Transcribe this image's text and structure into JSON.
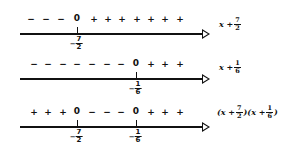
{
  "rows": [
    {
      "name": "sign-chart-x-plus-7-2",
      "expression": {
        "prefix": "x + ",
        "frac_num": "7",
        "frac_den": "2"
      },
      "signs": [
        {
          "s": "−",
          "x": 31
        },
        {
          "s": "−",
          "x": 46
        },
        {
          "s": "−",
          "x": 61
        },
        {
          "s": "0",
          "x": 77
        },
        {
          "s": "+",
          "x": 94
        },
        {
          "s": "+",
          "x": 108
        },
        {
          "s": "+",
          "x": 122
        },
        {
          "s": "+",
          "x": 137
        },
        {
          "s": "+",
          "x": 151
        },
        {
          "s": "+",
          "x": 165
        },
        {
          "s": "+",
          "x": 180
        }
      ],
      "ticks": [
        {
          "x": 77,
          "sign": "−",
          "num": "7",
          "den": "2"
        }
      ]
    },
    {
      "name": "sign-chart-x-plus-1-6",
      "expression": {
        "prefix": "x + ",
        "frac_num": "1",
        "frac_den": "6"
      },
      "signs": [
        {
          "s": "−",
          "x": 34
        },
        {
          "s": "−",
          "x": 48
        },
        {
          "s": "−",
          "x": 63
        },
        {
          "s": "−",
          "x": 77
        },
        {
          "s": "−",
          "x": 92
        },
        {
          "s": "−",
          "x": 107
        },
        {
          "s": "−",
          "x": 121
        },
        {
          "s": "0",
          "x": 136
        },
        {
          "s": "+",
          "x": 151
        },
        {
          "s": "+",
          "x": 165
        },
        {
          "s": "+",
          "x": 180
        }
      ],
      "ticks": [
        {
          "x": 136,
          "sign": "−",
          "num": "1",
          "den": "6"
        }
      ]
    },
    {
      "name": "sign-chart-product",
      "expression": {
        "p1": "(x + ",
        "n1": "7",
        "d1": "2",
        "p2": ")(x + ",
        "n2": "1",
        "d2": "6",
        "p3": ")"
      },
      "signs": [
        {
          "s": "+",
          "x": 34
        },
        {
          "s": "+",
          "x": 48
        },
        {
          "s": "+",
          "x": 63
        },
        {
          "s": "0",
          "x": 77
        },
        {
          "s": "−",
          "x": 92
        },
        {
          "s": "−",
          "x": 107
        },
        {
          "s": "−",
          "x": 121
        },
        {
          "s": "0",
          "x": 136
        },
        {
          "s": "+",
          "x": 151
        },
        {
          "s": "+",
          "x": 165
        },
        {
          "s": "+",
          "x": 180
        }
      ],
      "ticks": [
        {
          "x": 77,
          "sign": "−",
          "num": "7",
          "den": "2"
        },
        {
          "x": 136,
          "sign": "−",
          "num": "1",
          "den": "6"
        }
      ]
    }
  ]
}
